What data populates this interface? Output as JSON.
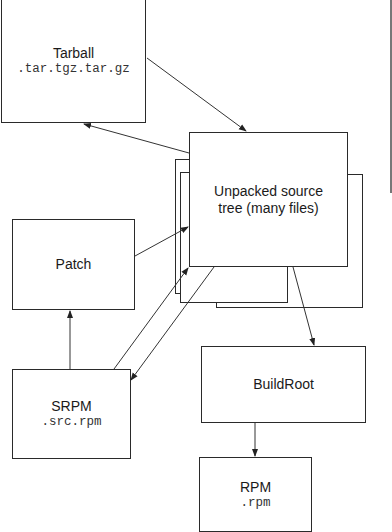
{
  "diagram": {
    "nodes": {
      "tarball": {
        "title": "Tarball",
        "subtitle": ".tar.tgz.tar.gz"
      },
      "source_tree": {
        "title": "Unpacked source tree (many files)"
      },
      "patch": {
        "title": "Patch"
      },
      "srpm": {
        "title": "SRPM",
        "subtitle": ".src.rpm"
      },
      "buildroot": {
        "title": "BuildRoot"
      },
      "rpm": {
        "title": "RPM",
        "subtitle": ".rpm"
      }
    },
    "edges": [
      {
        "from": "tarball",
        "to": "source_tree"
      },
      {
        "from": "source_tree",
        "to": "tarball"
      },
      {
        "from": "patch",
        "to": "source_tree"
      },
      {
        "from": "srpm",
        "to": "source_tree"
      },
      {
        "from": "source_tree",
        "to": "srpm"
      },
      {
        "from": "srpm",
        "to": "patch"
      },
      {
        "from": "source_tree",
        "to": "buildroot"
      },
      {
        "from": "buildroot",
        "to": "rpm"
      }
    ]
  }
}
